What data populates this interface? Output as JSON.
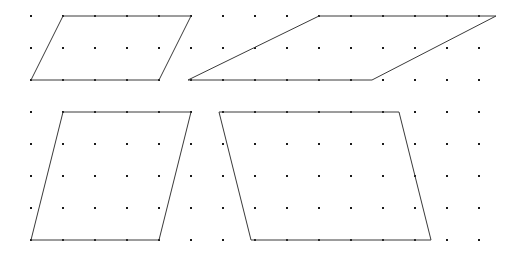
{
  "figure": {
    "width": 525,
    "height": 259,
    "background_color": "#ffffff"
  },
  "chart_data": {
    "type": "scatter",
    "subtitle": "",
    "xlabel": "",
    "ylabel": "",
    "grid": true,
    "legend": null,
    "xlim": [
      0,
      525
    ],
    "ylim": [
      0,
      259
    ],
    "lattice": {
      "name": "dot-grid",
      "spacing_x": 32,
      "spacing_y": 32,
      "origin_x": 31,
      "origin_y": 16,
      "cols": 15,
      "rows": 8,
      "dot_color": "#1a1a1a",
      "dot_size": 2,
      "x_ticks": [
        31,
        63,
        95,
        127,
        159,
        191,
        223,
        255,
        287,
        319,
        351,
        383,
        415,
        447,
        479
      ],
      "y_ticks": [
        16,
        48,
        80,
        112,
        144,
        176,
        208,
        240
      ]
    },
    "series": [
      {
        "name": "parallelogram-top-left",
        "stroke_color": "#3a3a3a",
        "closed": true,
        "lattice_points": [
          [
            1,
            0
          ],
          [
            5,
            0
          ],
          [
            4,
            2
          ],
          [
            0,
            2
          ]
        ],
        "points": [
          [
            63,
            16
          ],
          [
            191,
            16
          ],
          [
            159,
            80
          ],
          [
            31,
            80
          ]
        ],
        "base_cells": 4,
        "height_cells": 2,
        "skew_cells": -1
      },
      {
        "name": "parallelogram-top-right",
        "stroke_color": "#3a3a3a",
        "closed": true,
        "lattice_points": [
          [
            9,
            0
          ],
          [
            14.5,
            0
          ],
          [
            10.7,
            2
          ],
          [
            5,
            2
          ]
        ],
        "points": [
          [
            319,
            16
          ],
          [
            496,
            16
          ],
          [
            372,
            80
          ],
          [
            188,
            80
          ]
        ],
        "base_cells": 5.5,
        "height_cells": 2,
        "skew_cells": -4
      },
      {
        "name": "parallelogram-bottom-left",
        "stroke_color": "#3a3a3a",
        "closed": true,
        "lattice_points": [
          [
            1,
            3
          ],
          [
            5,
            3
          ],
          [
            4,
            7
          ],
          [
            0,
            7
          ]
        ],
        "points": [
          [
            63,
            112
          ],
          [
            191,
            112
          ],
          [
            159,
            240
          ],
          [
            31,
            240
          ]
        ],
        "base_cells": 4,
        "height_cells": 4,
        "skew_cells": -1
      },
      {
        "name": "parallelogram-bottom-right",
        "stroke_color": "#3a3a3a",
        "closed": true,
        "lattice_points": [
          [
            5.9,
            3
          ],
          [
            11.5,
            3
          ],
          [
            12.5,
            7
          ],
          [
            6.9,
            7
          ]
        ],
        "points": [
          [
            219,
            112
          ],
          [
            399,
            112
          ],
          [
            431,
            240
          ],
          [
            251,
            240
          ]
        ],
        "base_cells": 5.6,
        "height_cells": 4,
        "skew_cells": 1
      }
    ],
    "annotations": []
  }
}
